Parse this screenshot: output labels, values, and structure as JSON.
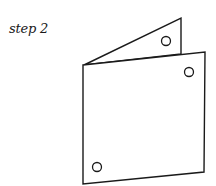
{
  "caption": {
    "text": "step 2"
  },
  "figure": {
    "stroke_color": "#1a1a1a",
    "back_flap": {
      "points": "84,65 181,18 181,54"
    },
    "front_panel": {
      "points": "83,65 205,52 204,172 83,184"
    },
    "holes": [
      {
        "name": "back-flap-hole",
        "cx": 166,
        "cy": 41,
        "r": 4.5
      },
      {
        "name": "front-top-right-hole",
        "cx": 189,
        "cy": 72,
        "r": 4.5
      },
      {
        "name": "front-bottom-left-hole",
        "cx": 97,
        "cy": 167,
        "r": 4.5
      }
    ]
  }
}
